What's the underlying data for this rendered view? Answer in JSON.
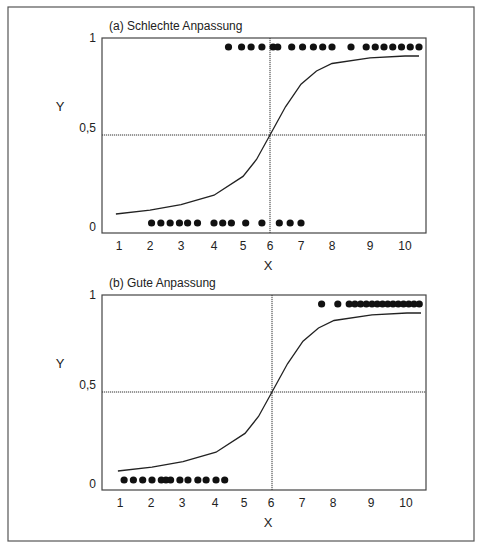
{
  "chart_data": [
    {
      "type": "scatter",
      "title": "(a) Schlechte Anpassung",
      "xlabel": "X",
      "ylabel": "Y",
      "x_ticks": [
        "1",
        "2",
        "3",
        "4",
        "5",
        "6",
        "7",
        "8",
        "9",
        "10"
      ],
      "y_ticks": [
        "0",
        "0,5",
        "1"
      ],
      "xlim": [
        0.6,
        10.6
      ],
      "ylim": [
        0,
        1
      ],
      "reference_lines": {
        "vertical_x": 6,
        "horizontal_y": 0.5
      },
      "series": [
        {
          "name": "Y=0",
          "y": 0,
          "x": [
            2.05,
            2.35,
            2.65,
            2.95,
            3.2,
            3.5,
            4.0,
            4.3,
            4.6,
            5.1,
            5.7,
            6.3,
            6.65,
            7.0
          ]
        },
        {
          "name": "Y=1",
          "y": 1,
          "x": [
            4.5,
            4.95,
            5.3,
            5.7,
            6.1,
            6.25,
            6.7,
            7.05,
            7.4,
            7.7,
            8.0,
            8.5,
            8.9,
            9.15,
            9.4,
            9.65,
            9.9,
            10.15,
            10.4
          ]
        },
        {
          "name": "logistic curve",
          "type": "line",
          "points": [
            [
              0.9,
              0.08
            ],
            [
              2,
              0.1
            ],
            [
              3,
              0.13
            ],
            [
              4,
              0.18
            ],
            [
              5,
              0.28
            ],
            [
              5.5,
              0.37
            ],
            [
              6,
              0.5
            ],
            [
              6.5,
              0.65
            ],
            [
              7,
              0.77
            ],
            [
              7.5,
              0.84
            ],
            [
              8,
              0.88
            ],
            [
              9,
              0.91
            ],
            [
              10,
              0.92
            ],
            [
              10.4,
              0.92
            ]
          ]
        }
      ]
    },
    {
      "type": "scatter",
      "title": "(b) Gute Anpassung",
      "xlabel": "X",
      "ylabel": "Y",
      "x_ticks": [
        "1",
        "2",
        "3",
        "4",
        "5",
        "6",
        "7",
        "8",
        "9",
        "10"
      ],
      "y_ticks": [
        "0",
        "0,5",
        "1"
      ],
      "xlim": [
        0.6,
        10.6
      ],
      "ylim": [
        0,
        1
      ],
      "reference_lines": {
        "vertical_x": 6,
        "horizontal_y": 0.5
      },
      "series": [
        {
          "name": "Y=0",
          "y": 0,
          "x": [
            1.1,
            1.4,
            1.7,
            2.0,
            2.3,
            2.45,
            2.6,
            2.9,
            3.15,
            3.45,
            3.7,
            4.0,
            4.3
          ]
        },
        {
          "name": "Y=1",
          "y": 1,
          "x": [
            7.6,
            8.1,
            8.4,
            8.55,
            8.7,
            8.85,
            9.0,
            9.15,
            9.3,
            9.45,
            9.6,
            9.75,
            9.9,
            10.05,
            10.2,
            10.35
          ]
        },
        {
          "name": "logistic curve",
          "type": "line",
          "points": [
            [
              0.9,
              0.08
            ],
            [
              2,
              0.1
            ],
            [
              3,
              0.13
            ],
            [
              4,
              0.18
            ],
            [
              5,
              0.28
            ],
            [
              5.5,
              0.37
            ],
            [
              6,
              0.5
            ],
            [
              6.5,
              0.65
            ],
            [
              7,
              0.77
            ],
            [
              7.5,
              0.84
            ],
            [
              8,
              0.88
            ],
            [
              9,
              0.91
            ],
            [
              10,
              0.92
            ],
            [
              10.4,
              0.92
            ]
          ]
        }
      ]
    }
  ]
}
